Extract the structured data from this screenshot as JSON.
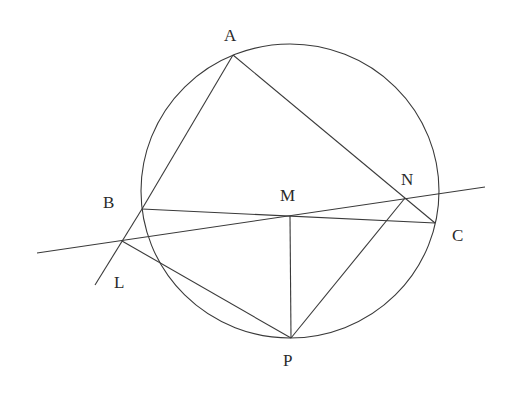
{
  "diagram": {
    "type": "geometry",
    "colors": {
      "line": "#3a3a3a",
      "text": "#2a2a2a",
      "background": "#ffffff"
    },
    "circle": {
      "cx": 290,
      "cy": 191,
      "rx": 149,
      "ry": 147
    },
    "points": {
      "A": {
        "x": 233,
        "y": 55,
        "label": "A",
        "lx": 224,
        "ly": 41
      },
      "B": {
        "x": 142,
        "y": 209,
        "label": "B",
        "lx": 103,
        "ly": 208
      },
      "C": {
        "x": 435,
        "y": 223,
        "label": "C",
        "lx": 452,
        "ly": 241
      },
      "M": {
        "x": 290,
        "y": 216,
        "label": "M",
        "lx": 280,
        "ly": 201
      },
      "N": {
        "x": 405,
        "y": 198,
        "label": "N",
        "lx": 401,
        "ly": 185
      },
      "L": {
        "x": 122,
        "y": 241,
        "label": "L",
        "lx": 114,
        "ly": 288
      },
      "P": {
        "x": 291,
        "y": 338,
        "label": "P",
        "lx": 283,
        "ly": 366
      }
    },
    "segments": [
      {
        "from": "A",
        "to": "B"
      },
      {
        "from": "A",
        "to": "C"
      },
      {
        "from": "B",
        "to": "C"
      },
      {
        "from": "M",
        "to": "P"
      },
      {
        "from": "N",
        "to": "P"
      },
      {
        "from": "L",
        "to": "P"
      }
    ],
    "extended_lines": [
      {
        "name": "line-LMN",
        "x1": 37,
        "y1": 253,
        "x2": 485,
        "y2": 187
      },
      {
        "name": "line-BL-extension",
        "x1": 142,
        "y1": 209,
        "x2": 95,
        "y2": 285
      }
    ]
  }
}
